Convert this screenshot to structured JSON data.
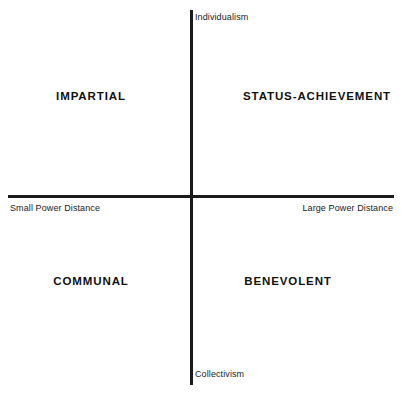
{
  "chart_data": {
    "type": "scatter",
    "title": "",
    "subtitle": "",
    "xlabel": "Power Distance",
    "ylabel": "Individualism – Collectivism",
    "grid": false,
    "legend": null,
    "axes": {
      "vertical": {
        "name": "vertical-axis",
        "top_pole": "Individualism",
        "bottom_pole": "Collectivism",
        "color": "#1a1a1a"
      },
      "horizontal": {
        "name": "horizontal-axis",
        "left_pole": "Small Power Distance",
        "right_pole": "Large Power Distance",
        "color": "#1a1a1a"
      }
    },
    "quadrants": [
      {
        "key": "impartial",
        "label": "IMPARTIAL",
        "position": "top-left",
        "x_pole": "Small Power Distance",
        "y_pole": "Individualism"
      },
      {
        "key": "status-achievement",
        "label": "STATUS-ACHIEVEMENT",
        "position": "top-right",
        "x_pole": "Large Power Distance",
        "y_pole": "Individualism"
      },
      {
        "key": "communal",
        "label": "COMMUNAL",
        "position": "bottom-left",
        "x_pole": "Small Power Distance",
        "y_pole": "Collectivism"
      },
      {
        "key": "benevolent",
        "label": "BENEVOLENT",
        "position": "bottom-right",
        "x_pole": "Large Power Distance",
        "y_pole": "Collectivism"
      }
    ],
    "values": [],
    "categories": []
  },
  "diagram": {
    "background_color": "#ffffff",
    "axis_color": "#1a1a1a",
    "label_color": "#111111",
    "poles": {
      "individualism": "Individualism",
      "collectivism": "Collectivism",
      "small_power_distance": "Small Power Distance",
      "large_power_distance": "Large Power Distance"
    },
    "quadrant_labels": {
      "impartial": "IMPARTIAL",
      "status_achievement": "STATUS-ACHIEVEMENT",
      "communal": "COMMUNAL",
      "benevolent": "BENEVOLENT"
    }
  }
}
